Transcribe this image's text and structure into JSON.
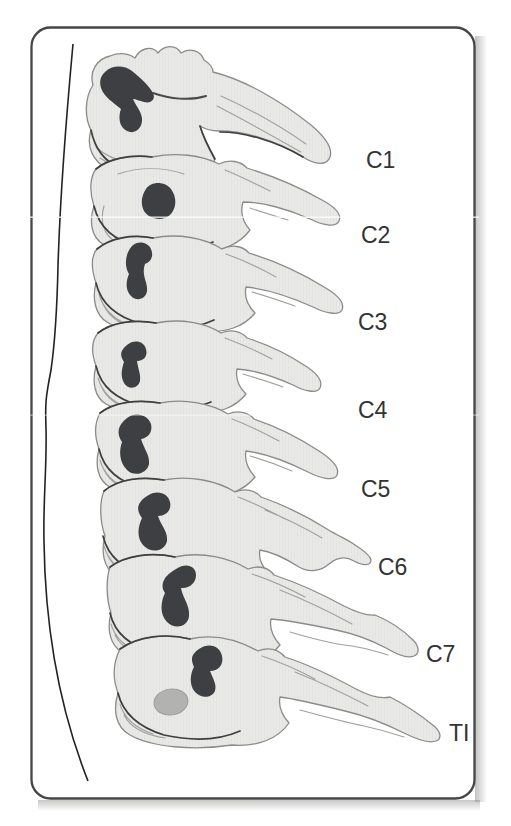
{
  "figure": {
    "kind": "anatomical-illustration-cervical-spine-lateral",
    "labels": [
      {
        "id": "c1",
        "text": "C1"
      },
      {
        "id": "c2",
        "text": "C2"
      },
      {
        "id": "c3",
        "text": "C3"
      },
      {
        "id": "c4",
        "text": "C4"
      },
      {
        "id": "c5",
        "text": "C5"
      },
      {
        "id": "c6",
        "text": "C6"
      },
      {
        "id": "c7",
        "text": "C7"
      },
      {
        "id": "t1",
        "text": "TI"
      }
    ],
    "colors": {
      "background": "#ffffff",
      "frame_border": "#464646",
      "bone_fill": "#e9eae7",
      "bone_outline": "#8b8c8a",
      "bone_outline_dark": "#3f3f3f",
      "foramen_fill": "#3e3f43",
      "t1_body_oval": "#b2b3b0",
      "label_color": "#333333",
      "page_shadow": "#8e8e8c"
    }
  }
}
